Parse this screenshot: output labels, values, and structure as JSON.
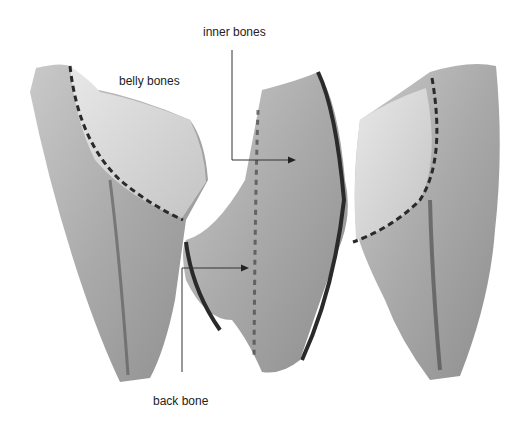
{
  "figure": {
    "colors": {
      "background": "#ffffff",
      "flesh": "#b8b8b8",
      "dark": "#4a4a4a",
      "line": "#333333"
    }
  },
  "labels": {
    "inner_bones": "inner bones",
    "belly_bones": "belly bones",
    "back_bone": "back bone"
  }
}
